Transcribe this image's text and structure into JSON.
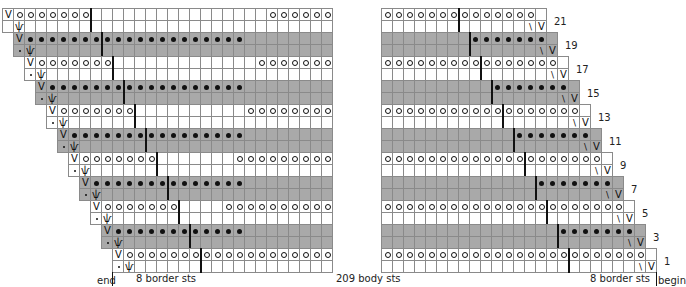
{
  "chart": {
    "rows_total": 22,
    "row_labels": [
      "21",
      "19",
      "17",
      "15",
      "13",
      "11",
      "9",
      "7",
      "5",
      "3",
      "1"
    ],
    "labels": {
      "end": "end",
      "begin": "begin",
      "left_border": "8 border sts",
      "body": "209 body sts",
      "right_border": "8 border sts"
    },
    "symbols": {
      "slip_stitch": "V",
      "yarn_over": "o",
      "purl_dot": "•",
      "knot": "ѱ",
      "decrease": "\\",
      "small_dot": "·"
    },
    "colors": {
      "gray_band": "#a9a9a9",
      "grid_line": "#8a8a8a",
      "symbol": "#111111"
    },
    "layout": {
      "cell_w": 11,
      "row_h": 12,
      "top_y": 8,
      "left_x0": 2,
      "left_panel_right": 336,
      "right_panel_left": 381,
      "right_panel_top_width": 15,
      "pairs": 11
    },
    "left_tail_o_counts": [
      6,
      6,
      7,
      7,
      8,
      8,
      9,
      9,
      10,
      11,
      11
    ],
    "right_dot_count": 7
  }
}
